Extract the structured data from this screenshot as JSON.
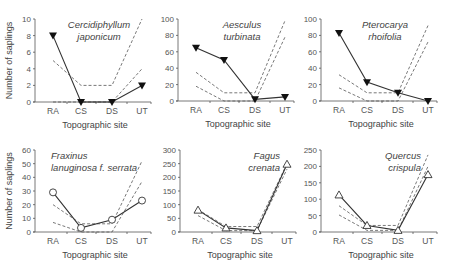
{
  "chart_data": [
    {
      "type": "line",
      "title": "Cercidiphyllum japonicum",
      "title_lines": [
        "Cercidiphyllum",
        "japonicum"
      ],
      "title_pos": "top-center",
      "categories": [
        "RA",
        "CS",
        "DS",
        "UT"
      ],
      "xlabel": "Topographic site",
      "ylabel": "Number of saplings",
      "ylim": [
        0,
        10
      ],
      "yticks": [
        0,
        2,
        4,
        6,
        8,
        10
      ],
      "marker": "triangle-down-filled",
      "series": [
        {
          "name": "Observed",
          "style": "solid",
          "values": [
            8,
            0,
            0,
            2
          ]
        },
        {
          "name": "Upper limit",
          "style": "dashed",
          "values": [
            5,
            2,
            2,
            10
          ]
        },
        {
          "name": "Lower limit",
          "style": "dashed",
          "values": [
            0,
            0,
            0,
            4
          ]
        }
      ]
    },
    {
      "type": "line",
      "title": "Aesculus turbinata",
      "title_lines": [
        "Aesculus",
        "turbinata"
      ],
      "title_pos": "top-center",
      "categories": [
        "RA",
        "CS",
        "DS",
        "UT"
      ],
      "xlabel": "Topographic site",
      "ylabel": "",
      "ylim": [
        0,
        100
      ],
      "yticks": [
        0,
        20,
        40,
        60,
        80,
        100
      ],
      "marker": "triangle-down-filled",
      "series": [
        {
          "name": "Observed",
          "style": "solid",
          "values": [
            65,
            50,
            2,
            5
          ]
        },
        {
          "name": "Upper limit",
          "style": "dashed",
          "values": [
            35,
            10,
            10,
            98
          ]
        },
        {
          "name": "Lower limit",
          "style": "dashed",
          "values": [
            18,
            0,
            0,
            78
          ]
        }
      ]
    },
    {
      "type": "line",
      "title": "Pterocarya rhoifolia",
      "title_lines": [
        "Pterocarya",
        "rhoifolia"
      ],
      "title_pos": "top-center",
      "categories": [
        "RA",
        "CS",
        "DS",
        "UT"
      ],
      "xlabel": "Topographic site",
      "ylabel": "",
      "ylim": [
        0,
        100
      ],
      "yticks": [
        0,
        20,
        40,
        60,
        80,
        100
      ],
      "marker": "triangle-down-filled",
      "series": [
        {
          "name": "Observed",
          "style": "solid",
          "values": [
            83,
            23,
            10,
            0
          ]
        },
        {
          "name": "Upper limit",
          "style": "dashed",
          "values": [
            32,
            10,
            10,
            92
          ]
        },
        {
          "name": "Lower limit",
          "style": "dashed",
          "values": [
            16,
            0,
            0,
            72
          ]
        }
      ]
    },
    {
      "type": "line",
      "title": "Fraxinus lanuginosa f. serrata",
      "title_lines": [
        "Fraxinus",
        "lanuginosa f. serrata"
      ],
      "title_pos": "top-left",
      "categories": [
        "RA",
        "CS",
        "DS",
        "UT"
      ],
      "xlabel": "Topographic site",
      "ylabel": "Number of saplings",
      "ylim": [
        0,
        60
      ],
      "yticks": [
        0,
        10,
        20,
        30,
        40,
        50,
        60
      ],
      "marker": "circle-open",
      "series": [
        {
          "name": "Observed",
          "style": "solid",
          "values": [
            29,
            3,
            9,
            23
          ]
        },
        {
          "name": "Upper limit",
          "style": "dashed",
          "values": [
            20,
            6,
            6,
            52
          ]
        },
        {
          "name": "Lower limit",
          "style": "dashed",
          "values": [
            7,
            0,
            0,
            37
          ]
        }
      ]
    },
    {
      "type": "line",
      "title": "Fagus crenata",
      "title_lines": [
        "Fagus",
        "crenata"
      ],
      "title_pos": "top-right",
      "categories": [
        "RA",
        "CS",
        "DS",
        "UT"
      ],
      "xlabel": "Topographic site",
      "ylabel": "",
      "ylim": [
        0,
        300
      ],
      "yticks": [
        0,
        50,
        100,
        150,
        200,
        250,
        300
      ],
      "marker": "triangle-up-open",
      "series": [
        {
          "name": "Observed",
          "style": "solid",
          "values": [
            80,
            15,
            5,
            248
          ]
        },
        {
          "name": "Upper limit",
          "style": "dashed",
          "values": [
            82,
            20,
            20,
            250
          ]
        },
        {
          "name": "Lower limit",
          "style": "dashed",
          "values": [
            60,
            5,
            5,
            230
          ]
        }
      ]
    },
    {
      "type": "line",
      "title": "Quercus crispula",
      "title_lines": [
        "Quercus",
        "crispula"
      ],
      "title_pos": "top-right",
      "categories": [
        "RA",
        "CS",
        "DS",
        "UT"
      ],
      "xlabel": "Topographic site",
      "ylabel": "",
      "ylim": [
        0,
        250
      ],
      "yticks": [
        0,
        50,
        100,
        150,
        200,
        250
      ],
      "marker": "triangle-up-open",
      "series": [
        {
          "name": "Observed",
          "style": "solid",
          "values": [
            113,
            20,
            5,
            175
          ]
        },
        {
          "name": "Upper limit",
          "style": "dashed",
          "values": [
            80,
            20,
            20,
            235
          ]
        },
        {
          "name": "Lower limit",
          "style": "dashed",
          "values": [
            52,
            5,
            5,
            200
          ]
        }
      ]
    }
  ],
  "colors": {
    "observed_line": "#333333",
    "dashed_line": "#555555",
    "axis": "#555555",
    "text": "#444444"
  }
}
